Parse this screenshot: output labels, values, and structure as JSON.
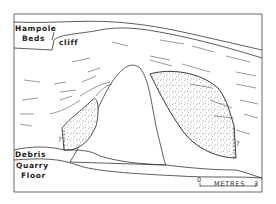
{
  "diagram": {
    "type": "geological cross-section",
    "labels": {
      "hampole_line1": "Hampole",
      "hampole_line2": "Beds",
      "cliff": "cliff",
      "debris": "Debris",
      "quarry_line1": "Quarry",
      "quarry_line2": "Floor",
      "uncertain_left": "?",
      "uncertain_right": "?"
    },
    "scale_bar": {
      "start": "0",
      "end": "3",
      "unit": "METRES"
    },
    "colors": {
      "line": "#333333",
      "background": "#ffffff"
    }
  }
}
